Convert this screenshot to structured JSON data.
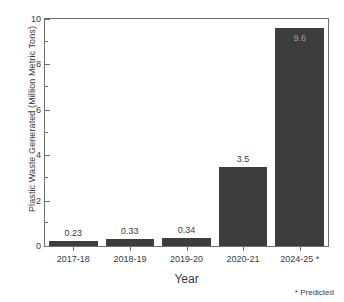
{
  "chart_data": {
    "type": "bar",
    "title": "",
    "xlabel": "Year",
    "ylabel": "Plastic Waste Generated (Million Metric Tons)",
    "categories": [
      "2017-18",
      "2018-19",
      "2019-20",
      "2020-21",
      "2024-25 *"
    ],
    "values": [
      0.23,
      0.33,
      0.34,
      3.5,
      9.6
    ],
    "value_labels": [
      "0.23",
      "0.33",
      "0.34",
      "3.5",
      "9.6"
    ],
    "ylim": [
      0,
      10
    ],
    "yticks": [
      0,
      2,
      4,
      6,
      8,
      10
    ],
    "ytick_labels": [
      "0",
      "2",
      "4",
      "6",
      "8",
      "10"
    ],
    "yminor_ticks": [
      1,
      3,
      5,
      7,
      9
    ],
    "grid": false,
    "legend": null,
    "annotations": [
      "* Predicted"
    ],
    "bar_color": "#3d3d3d",
    "inside_label_color": "#9b9b9b",
    "axis_color": "#6f6f6f",
    "background": "#ffffff"
  },
  "footnote": "* Predicted"
}
